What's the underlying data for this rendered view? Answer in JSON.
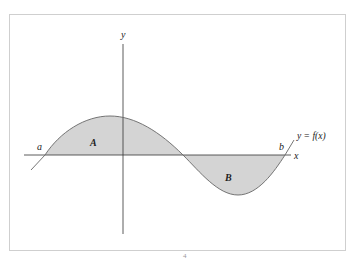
{
  "diagram": {
    "title": "",
    "labels": {
      "y_axis": "y",
      "x_axis": "x",
      "left_bound": "a",
      "right_bound": "b",
      "region_above": "A",
      "region_below": "B",
      "curve": "y = f(x)"
    },
    "caption_mark": "4",
    "colors": {
      "fill": "#d4d4d4",
      "curve": "#666666",
      "axis": "#333333",
      "frame": "#cfcfcf"
    },
    "geometry": {
      "origin_px": [
        123,
        155
      ],
      "left_crossing_px": 45,
      "middle_crossing_px": 183,
      "right_crossing_px": 285,
      "max_px": [
        110,
        116
      ],
      "min_px": [
        238,
        195
      ]
    }
  }
}
